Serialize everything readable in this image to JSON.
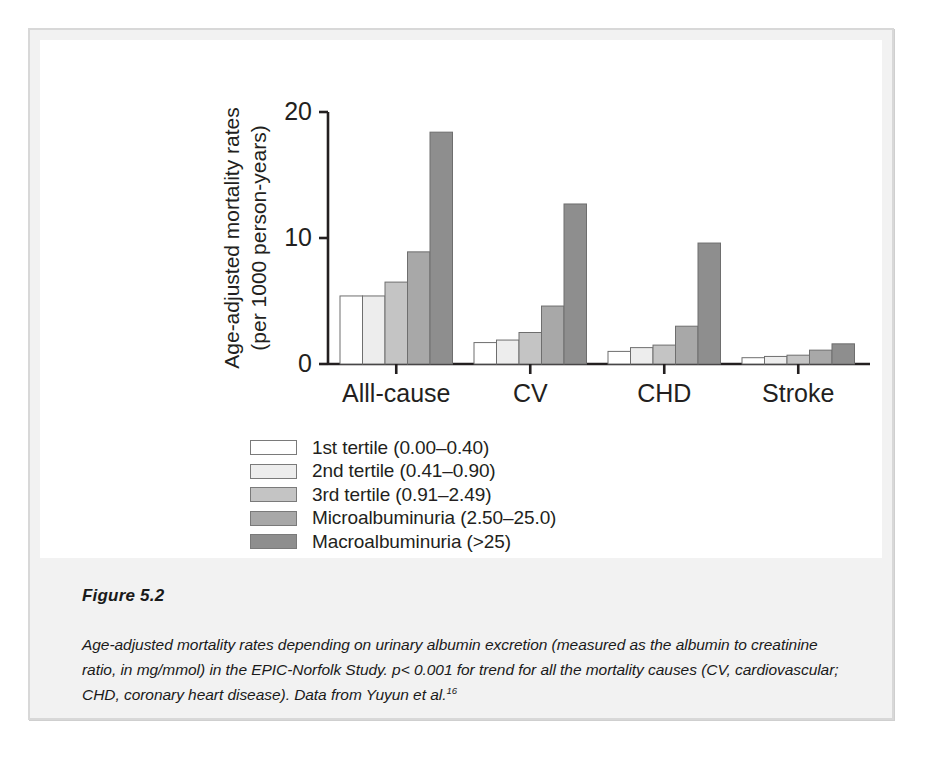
{
  "figure": {
    "number_label": "Figure 5.2",
    "caption_main": "Age-adjusted mortality rates depending on urinary albumin excretion (measured as the albumin to creatinine ratio, in mg/mmol) in the EPIC-Norfolk Study. p< 0.001 for trend for all the mortality causes (CV, cardiovascular; CHD, coronary heart disease). Data from Yuyun et al.",
    "caption_superscript": "16"
  },
  "chart_data": {
    "type": "bar",
    "title": "",
    "xlabel": "",
    "ylabel": "Age-adjusted mortality rates (per 1000 person-years)",
    "ylabel_line1": "Age-adjusted mortality rates",
    "ylabel_line2": "(per 1000 person-years)",
    "categories": [
      "Alll-cause",
      "CV",
      "CHD",
      "Stroke"
    ],
    "ylim": [
      0,
      20
    ],
    "yticks": [
      0,
      10,
      20
    ],
    "ytick_labels": [
      "0",
      "10",
      "20"
    ],
    "grid": false,
    "legend_position": "below-center",
    "series": [
      {
        "name": "1st tertile (0.00–0.40)",
        "color": "#ffffff",
        "values": [
          5.4,
          1.7,
          1.0,
          0.5
        ]
      },
      {
        "name": "2nd tertile (0.41–0.90)",
        "color": "#ededed",
        "values": [
          5.4,
          1.9,
          1.3,
          0.6
        ]
      },
      {
        "name": "3rd tertile (0.91–2.49)",
        "color": "#c4c4c4",
        "values": [
          6.5,
          2.5,
          1.5,
          0.7
        ]
      },
      {
        "name": "Microalbuminuria (2.50–25.0)",
        "color": "#a8a8a8",
        "values": [
          8.9,
          4.6,
          3.0,
          1.1
        ]
      },
      {
        "name": "Macroalbuminuria (>25)",
        "color": "#8e8e8e",
        "values": [
          18.4,
          12.7,
          9.6,
          1.6
        ]
      }
    ]
  }
}
